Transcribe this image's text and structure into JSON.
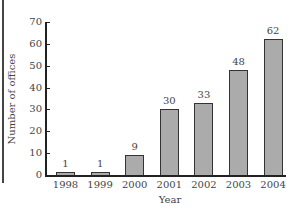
{
  "chart_data": {
    "type": "bar",
    "title": "",
    "xlabel": "Year",
    "ylabel": "Number of offices",
    "categories": [
      "1998",
      "1999",
      "2000",
      "2001",
      "2002",
      "2003",
      "2004"
    ],
    "values": [
      1,
      1,
      9,
      30,
      33,
      48,
      62
    ],
    "data_labels": [
      "1",
      "1",
      "9",
      "30",
      "33",
      "48",
      "62"
    ],
    "ylim": [
      0,
      70
    ],
    "yticks": [
      0,
      10,
      20,
      30,
      40,
      50,
      60,
      70
    ],
    "ytick_labels": [
      "0",
      "10",
      "20",
      "30",
      "40",
      "50",
      "60",
      "70"
    ],
    "grid": false,
    "legend": null,
    "bar_color": "#ababab",
    "bar_edge_color": "#333333"
  }
}
